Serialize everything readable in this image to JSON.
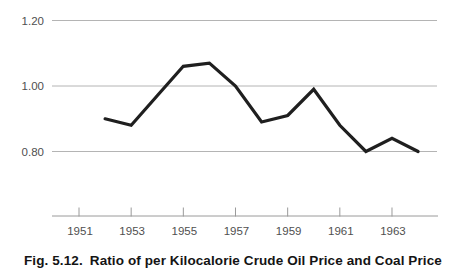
{
  "figure": {
    "caption_label": "Fig. 5.12.",
    "caption_text": "Ratio of per Kilocalorie Crude Oil Price and Coal Price"
  },
  "chart_data": {
    "type": "line",
    "xlabel": "",
    "ylabel": "",
    "x": [
      1952,
      1953,
      1954,
      1955,
      1956,
      1957,
      1958,
      1959,
      1960,
      1961,
      1962,
      1963,
      1964
    ],
    "series": [
      {
        "name": "crude-oil-price-to-coal-price-ratio",
        "values": [
          0.9,
          0.88,
          0.97,
          1.06,
          1.07,
          1.0,
          0.89,
          0.91,
          0.99,
          0.88,
          0.8,
          0.84,
          0.8
        ]
      }
    ],
    "x_ticks": [
      {
        "value": 1951,
        "label": "1951"
      },
      {
        "value": 1953,
        "label": "1953"
      },
      {
        "value": 1955,
        "label": "1955"
      },
      {
        "value": 1957,
        "label": "1957"
      },
      {
        "value": 1959,
        "label": "1959"
      },
      {
        "value": 1961,
        "label": "1961"
      },
      {
        "value": 1963,
        "label": "1963"
      }
    ],
    "y_ticks": [
      {
        "value": 1.2,
        "label": "1.20"
      },
      {
        "value": 1.0,
        "label": "1.00"
      },
      {
        "value": 0.8,
        "label": "0.80"
      }
    ],
    "xlim": [
      1950,
      1964.75
    ],
    "ylim": [
      0.6,
      1.25
    ],
    "grid": "horizontal",
    "legend": "none",
    "colors": {
      "line": "#1f1f1f",
      "grid": "#b4b4b4",
      "axis": "#9a9a9a",
      "tick_label": "#4f4f4f",
      "caption": "#141414",
      "background": "#ffffff"
    }
  }
}
